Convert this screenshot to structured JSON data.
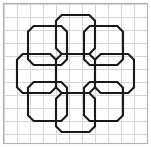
{
  "figure": {
    "shape_count": 9,
    "shape_name": "octagon",
    "arrangement": "ring-of-eight-around-center"
  },
  "canvas": {
    "width": 151,
    "height": 147,
    "background_color": "#ffffff"
  },
  "border": {
    "x": 3.5,
    "y": 3.5,
    "width": 144,
    "height": 140,
    "color": "#b4b4b4",
    "stroke_width": 1.2
  },
  "grid": {
    "visible": true,
    "color": "#d6d6d6",
    "stroke_width": 1,
    "cell_size": 13,
    "origin_x": 4,
    "origin_y": 4,
    "columns": 11,
    "rows": 11,
    "x_lines": [
      4,
      17,
      30,
      43,
      56,
      69,
      82,
      95,
      108,
      121,
      134,
      147
    ],
    "y_lines": [
      4,
      17,
      30,
      43,
      56,
      69,
      82,
      95,
      108,
      121,
      134,
      143
    ]
  },
  "style": {
    "line_color": "#1a1a1a",
    "line_width": 2.1,
    "fill": "none",
    "line_join": "miter"
  },
  "octagons": [
    {
      "name": "center-octagon",
      "position": "center",
      "center_x": 75.5,
      "center_y": 73.5,
      "radius": 19.5,
      "corner_cut": 5.7
    },
    {
      "name": "top-octagon",
      "position": "north",
      "center_x": 75.5,
      "center_y": 34.5,
      "radius": 19.5,
      "corner_cut": 5.7
    },
    {
      "name": "bottom-octagon",
      "position": "south",
      "center_x": 75.5,
      "center_y": 112.5,
      "radius": 19.5,
      "corner_cut": 5.7
    },
    {
      "name": "left-octagon",
      "position": "west",
      "center_x": 36.5,
      "center_y": 73.5,
      "radius": 19.5,
      "corner_cut": 5.7
    },
    {
      "name": "right-octagon",
      "position": "east",
      "center_x": 114.5,
      "center_y": 73.5,
      "radius": 19.5,
      "corner_cut": 5.7
    },
    {
      "name": "top-left-octagon",
      "position": "northwest",
      "center_x": 47.5,
      "center_y": 45.5,
      "radius": 19.5,
      "corner_cut": 5.7
    },
    {
      "name": "top-right-octagon",
      "position": "northeast",
      "center_x": 103.5,
      "center_y": 45.5,
      "radius": 19.5,
      "corner_cut": 5.7
    },
    {
      "name": "bottom-left-octagon",
      "position": "southwest",
      "center_x": 47.5,
      "center_y": 101.5,
      "radius": 19.5,
      "corner_cut": 5.7
    },
    {
      "name": "bottom-right-octagon",
      "position": "southeast",
      "center_x": 103.5,
      "center_y": 101.5,
      "radius": 19.5,
      "corner_cut": 5.7
    }
  ]
}
